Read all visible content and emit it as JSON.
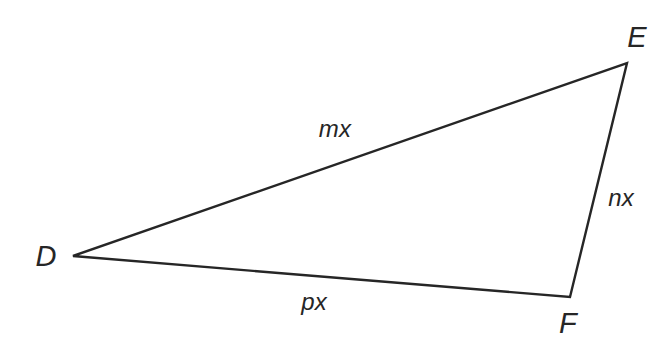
{
  "diagram": {
    "type": "triangle",
    "name": "triangle-DEF",
    "background_color": "#ffffff",
    "stroke_color": "#262626",
    "stroke_width": 2.4,
    "canvas": {
      "width": 669,
      "height": 344
    },
    "vertices": [
      {
        "id": "D",
        "label": "D",
        "x": 73,
        "y": 256,
        "label_x": 46,
        "label_y": 256
      },
      {
        "id": "E",
        "label": "E",
        "x": 627,
        "y": 63,
        "label_x": 637,
        "label_y": 37
      },
      {
        "id": "F",
        "label": "F",
        "x": 570,
        "y": 297,
        "label_x": 568,
        "label_y": 323
      }
    ],
    "edges": [
      {
        "id": "DE",
        "from": "D",
        "to": "E",
        "label": "mx",
        "label_x": 335,
        "label_y": 129
      },
      {
        "id": "EF",
        "from": "E",
        "to": "F",
        "label": "nx",
        "label_x": 621,
        "label_y": 198
      },
      {
        "id": "DF",
        "from": "D",
        "to": "F",
        "label": "px",
        "label_x": 314,
        "label_y": 302
      }
    ],
    "path": "M 73 256 L 627 63 L 570 297 Z",
    "labels": {
      "vertex_D": "D",
      "vertex_E": "E",
      "vertex_F": "F",
      "side_DE": "mx",
      "side_EF": "nx",
      "side_DF": "px"
    }
  }
}
